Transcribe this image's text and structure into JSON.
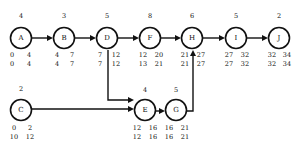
{
  "diagram": {
    "type": "activity-on-node network",
    "nodes": [
      {
        "id": "A",
        "duration": "4",
        "es": "0",
        "ef": "4",
        "ls": "0",
        "lf": "4",
        "cx": 21,
        "cy": 38
      },
      {
        "id": "B",
        "duration": "3",
        "es": "4",
        "ef": "7",
        "ls": "4",
        "lf": "7",
        "cx": 64,
        "cy": 38
      },
      {
        "id": "D",
        "duration": "5",
        "es": "7",
        "ef": "12",
        "ls": "7",
        "lf": "12",
        "cx": 107,
        "cy": 38
      },
      {
        "id": "F",
        "duration": "8",
        "es": "12",
        "ef": "20",
        "ls": "13",
        "lf": "21",
        "cx": 150,
        "cy": 38
      },
      {
        "id": "H",
        "duration": "6",
        "es": "21",
        "ef": "27",
        "ls": "21",
        "lf": "27",
        "cx": 192,
        "cy": 38
      },
      {
        "id": "I",
        "duration": "5",
        "es": "27",
        "ef": "32",
        "ls": "27",
        "lf": "32",
        "cx": 236,
        "cy": 38
      },
      {
        "id": "J",
        "duration": "2",
        "es": "32",
        "ef": "34",
        "ls": "32",
        "lf": "34",
        "cx": 279,
        "cy": 38
      },
      {
        "id": "C",
        "duration": "2",
        "es": "0",
        "ef": "2",
        "ls": "10",
        "lf": "12",
        "cx": 21,
        "cy": 110
      },
      {
        "id": "E",
        "duration": "4",
        "es": "12",
        "ef": "16",
        "ls": "12",
        "lf": "16",
        "cx": 145,
        "cy": 111
      },
      {
        "id": "G",
        "duration": "5",
        "es": "16",
        "ef": "21",
        "ls": "16",
        "lf": "21",
        "cx": 176,
        "cy": 111
      }
    ],
    "edges": [
      {
        "from": "A",
        "to": "B"
      },
      {
        "from": "B",
        "to": "D"
      },
      {
        "from": "D",
        "to": "F"
      },
      {
        "from": "F",
        "to": "H"
      },
      {
        "from": "H",
        "to": "I"
      },
      {
        "from": "I",
        "to": "J"
      },
      {
        "from": "D",
        "to": "E"
      },
      {
        "from": "C",
        "to": "E"
      },
      {
        "from": "E",
        "to": "G"
      },
      {
        "from": "G",
        "to": "H"
      }
    ]
  }
}
